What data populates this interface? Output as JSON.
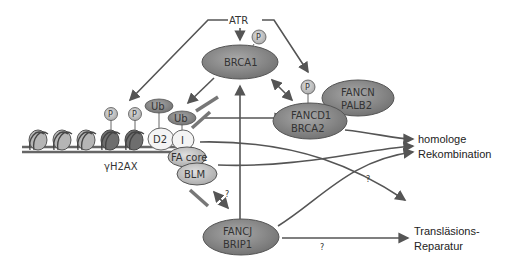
{
  "diagram": {
    "nodes": {
      "atr": "ATR",
      "brca1": "BRCA1",
      "fancd1_brca2": [
        "FANCD1",
        "BRCA2"
      ],
      "fancn_palb2": [
        "FANCN",
        "PALB2"
      ],
      "d2": "D2",
      "i": "I",
      "ub1": "Ub",
      "ub2": "Ub",
      "fa_core": "FA core",
      "blm": "BLM",
      "fancj_brip1": [
        "FANCJ",
        "BRIP1"
      ],
      "gamma_h2ax": "γH2AX",
      "phospho": "P"
    },
    "outcomes": {
      "hr": [
        "homologe",
        "Rekombination"
      ],
      "tls": [
        "Transläsions-",
        "Reparatur"
      ]
    },
    "uncertain_label": "?",
    "colors": {
      "dark_ellipse": "#8a8a8a",
      "light_ellipse": "#c8c8c8",
      "white_ellipse": "#f4f4f4",
      "line": "#555555"
    }
  }
}
